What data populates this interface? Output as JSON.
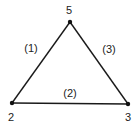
{
  "diagram": {
    "type": "triangle-graph",
    "nodes": [
      {
        "id": "top",
        "label": "5",
        "x": 70,
        "y": 22,
        "lx": 69,
        "ly": 10
      },
      {
        "id": "left",
        "label": "2",
        "x": 12,
        "y": 103,
        "lx": 11,
        "ly": 117
      },
      {
        "id": "right",
        "label": "3",
        "x": 128,
        "y": 104,
        "lx": 128,
        "ly": 117
      }
    ],
    "edges": [
      {
        "from": "left",
        "to": "top",
        "label": "(1)",
        "lx": 31,
        "ly": 48
      },
      {
        "from": "left",
        "to": "right",
        "label": "(2)",
        "lx": 70,
        "ly": 93
      },
      {
        "from": "top",
        "to": "right",
        "label": "(3)",
        "lx": 109,
        "ly": 49
      }
    ],
    "colors": {
      "line": "#1a1a1a",
      "node": "#111111"
    }
  }
}
